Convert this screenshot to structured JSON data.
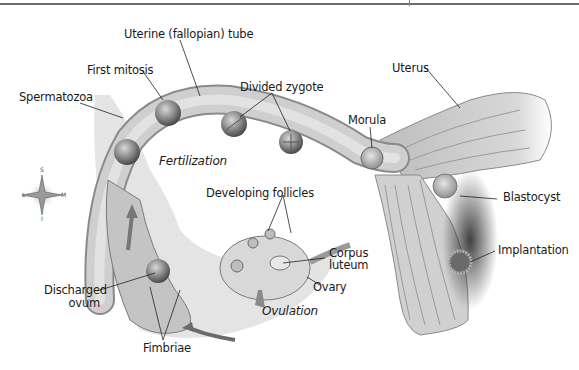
{
  "diagram": {
    "labels": {
      "uterine_tube": "Uterine (fallopian) tube",
      "first_mitosis": "First mitosis",
      "spermatozoa": "Spermatozoa",
      "divided_zygote": "Divided zygote",
      "uterus": "Uterus",
      "morula": "Morula",
      "fertilization": "Fertilization",
      "blastocyst": "Blastocyst",
      "developing_follicles": "Developing follicles",
      "corpus_luteum_1": "Corpus",
      "corpus_luteum_2": "luteum",
      "ovary": "Ovary",
      "implantation": "Implantation",
      "discharged_ovum_1": "Discharged",
      "discharged_ovum_2": "ovum",
      "ovulation": "Ovulation",
      "fimbriae": "Fimbriae"
    },
    "compass": {
      "top": "S",
      "left": "L",
      "right": "M",
      "bottom": "I"
    },
    "colors": {
      "tissue": "#c8c8c8",
      "tissue_dark": "#8a8a8a",
      "cell": "#7a7a7a",
      "label_line": "#222222"
    }
  }
}
